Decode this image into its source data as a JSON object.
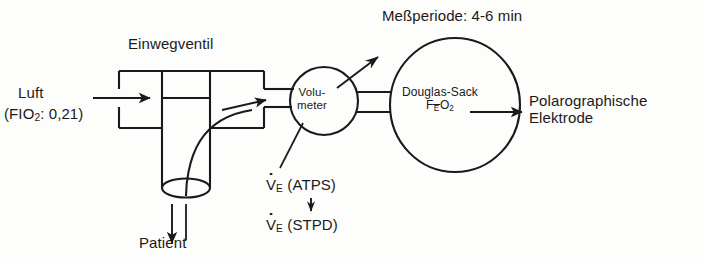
{
  "figure": {
    "type": "schematic-diagram",
    "language": "de",
    "background_color": "#fdfdfb",
    "line_color": "#1a1a1a"
  },
  "labels": {
    "measurement_period": "Meßperiode: 4-6 min",
    "one_way_valve": "Einwegventil",
    "air": "Luft",
    "air_fraction_prefix": "(FIO",
    "air_fraction_sub": "2",
    "air_fraction_suffix": ": 0,21)",
    "volumeter_line1": "Volu-",
    "volumeter_line2": "meter",
    "douglas_bag": "Douglas-Sack",
    "douglas_f": "F",
    "douglas_e_bar": "E",
    "douglas_o": "O",
    "douglas_o_sub": "2",
    "electrode_line1": "Polarographische",
    "electrode_line2": "Elektrode",
    "ve_symbol": "V",
    "ve_sub": "E",
    "ve_atps": "(ATPS)",
    "ve_stpd": "(STPD)",
    "patient": "Patient"
  },
  "flow_arrows": [
    {
      "name": "air-inlet-arrow",
      "direction": "right",
      "meaning": "ambient air in"
    },
    {
      "name": "patient-arrow",
      "direction": "down",
      "meaning": "to patient mouthpiece"
    },
    {
      "name": "expired-gas-arrow",
      "direction": "up-right",
      "meaning": "expired gas to volumeter"
    },
    {
      "name": "volumeter-vent-arrow",
      "direction": "up-right",
      "meaning": "volumeter reading / vent"
    },
    {
      "name": "ve-conversion-arrow",
      "direction": "down",
      "meaning": "ATPS to STPD conversion"
    },
    {
      "name": "sample-to-electrode-arrow",
      "direction": "right",
      "meaning": "gas sample to electrode"
    }
  ],
  "components": [
    {
      "name": "one-way-valve-box",
      "shape": "rectangle-with-internal-leaflets"
    },
    {
      "name": "mouthpiece-tube",
      "shape": "cylinder-with-ellipse-rim"
    },
    {
      "name": "volumeter",
      "shape": "circle"
    },
    {
      "name": "douglas-bag",
      "shape": "large-circle"
    }
  ]
}
